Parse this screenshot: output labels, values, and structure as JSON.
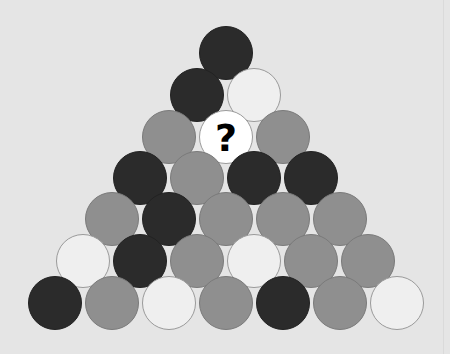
{
  "puzzle": {
    "colors": {
      "background": "#e5e5e5",
      "dark": "#2b2b2b",
      "gray": "#8f8f8f",
      "light": "#efefef",
      "white": "#ffffff"
    },
    "radius": 27,
    "rows": [
      {
        "y": 53,
        "balls": [
          {
            "x": 226,
            "color": "dark"
          }
        ]
      },
      {
        "y": 95,
        "balls": [
          {
            "x": 197,
            "color": "dark"
          },
          {
            "x": 254,
            "color": "light"
          }
        ]
      },
      {
        "y": 137,
        "balls": [
          {
            "x": 169,
            "color": "gray"
          },
          {
            "x": 226,
            "color": "white",
            "label": "?"
          },
          {
            "x": 283,
            "color": "gray"
          }
        ]
      },
      {
        "y": 178,
        "balls": [
          {
            "x": 140,
            "color": "dark"
          },
          {
            "x": 197,
            "color": "gray"
          },
          {
            "x": 254,
            "color": "dark"
          },
          {
            "x": 311,
            "color": "dark"
          }
        ]
      },
      {
        "y": 219,
        "balls": [
          {
            "x": 112,
            "color": "gray"
          },
          {
            "x": 169,
            "color": "dark"
          },
          {
            "x": 226,
            "color": "gray"
          },
          {
            "x": 283,
            "color": "gray"
          },
          {
            "x": 340,
            "color": "gray"
          }
        ]
      },
      {
        "y": 261,
        "balls": [
          {
            "x": 83,
            "color": "light"
          },
          {
            "x": 140,
            "color": "dark"
          },
          {
            "x": 197,
            "color": "gray"
          },
          {
            "x": 254,
            "color": "light"
          },
          {
            "x": 311,
            "color": "gray"
          },
          {
            "x": 368,
            "color": "gray"
          }
        ]
      },
      {
        "y": 303,
        "balls": [
          {
            "x": 55,
            "color": "dark"
          },
          {
            "x": 112,
            "color": "gray"
          },
          {
            "x": 169,
            "color": "light"
          },
          {
            "x": 226,
            "color": "gray"
          },
          {
            "x": 283,
            "color": "dark"
          },
          {
            "x": 340,
            "color": "gray"
          },
          {
            "x": 397,
            "color": "light"
          }
        ]
      }
    ]
  }
}
